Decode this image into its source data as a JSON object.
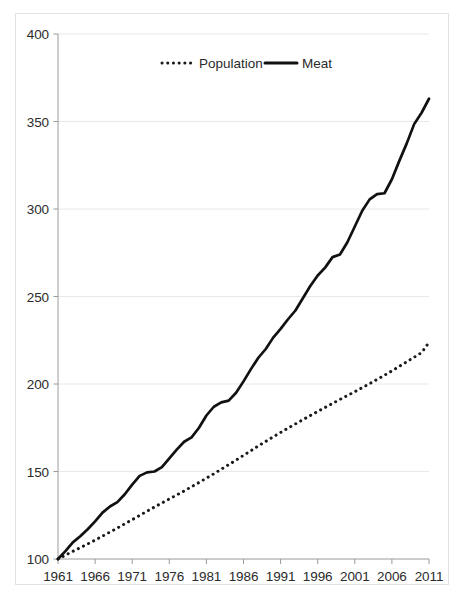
{
  "chart_data": {
    "type": "line",
    "title": "",
    "subtitle": "",
    "xlabel": "",
    "ylabel": "",
    "xlim": [
      1961,
      2011
    ],
    "ylim": [
      100,
      400
    ],
    "grid": true,
    "legend_position": "top-center",
    "y_ticks": [
      "400",
      "350",
      "300",
      "250",
      "200",
      "150",
      "100"
    ],
    "y_tick_values": [
      400,
      350,
      300,
      250,
      200,
      150,
      100
    ],
    "x_ticks": [
      "1961",
      "1966",
      "1971",
      "1976",
      "1981",
      "1986",
      "1991",
      "1996",
      "2001",
      "2006",
      "2011"
    ],
    "x_tick_values": [
      1961,
      1966,
      1971,
      1976,
      1981,
      1986,
      1991,
      1996,
      2001,
      2006,
      2011
    ],
    "x": [
      1961,
      1962,
      1963,
      1964,
      1965,
      1966,
      1967,
      1968,
      1969,
      1970,
      1971,
      1972,
      1973,
      1974,
      1975,
      1976,
      1977,
      1978,
      1979,
      1980,
      1981,
      1982,
      1983,
      1984,
      1985,
      1986,
      1987,
      1988,
      1989,
      1990,
      1991,
      1992,
      1993,
      1994,
      1995,
      1996,
      1997,
      1998,
      1999,
      2000,
      2001,
      2002,
      2003,
      2004,
      2005,
      2006,
      2007,
      2008,
      2009,
      2010,
      2011
    ],
    "series": [
      {
        "name": "Population",
        "style": "dotted",
        "color": "#1a1a1a",
        "values": [
          100.0,
          102.2,
          104.4,
          106.5,
          108.6,
          110.8,
          113.1,
          115.4,
          117.7,
          120.1,
          122.5,
          124.9,
          127.3,
          129.7,
          132.0,
          134.3,
          136.6,
          138.9,
          141.3,
          143.7,
          146.2,
          148.7,
          151.3,
          153.9,
          156.5,
          159.2,
          161.9,
          164.6,
          167.2,
          169.8,
          172.3,
          174.8,
          177.2,
          179.6,
          182.0,
          184.3,
          186.6,
          188.9,
          191.2,
          193.4,
          195.6,
          197.9,
          200.2,
          202.6,
          205.0,
          207.5,
          210.1,
          212.7,
          215.3,
          217.9,
          223.8
        ]
      },
      {
        "name": "Meat",
        "style": "solid",
        "color": "#111111",
        "values": [
          100.0,
          104.5,
          109.5,
          113.0,
          117.0,
          121.5,
          126.5,
          130.0,
          132.5,
          137.0,
          142.5,
          147.5,
          149.5,
          150.0,
          152.5,
          157.5,
          162.5,
          167.0,
          169.5,
          175.0,
          182.0,
          187.0,
          189.5,
          190.5,
          195.0,
          201.5,
          208.5,
          215.0,
          220.0,
          226.5,
          231.5,
          237.0,
          242.0,
          249.0,
          256.0,
          262.0,
          266.5,
          272.5,
          274.0,
          281.0,
          290.0,
          299.0,
          305.5,
          308.5,
          309.0,
          317.0,
          327.5,
          337.5,
          348.5,
          355.0,
          363.0
        ]
      }
    ]
  },
  "legend": {
    "items": [
      {
        "label": "Population",
        "marker": "dotted-line-marker"
      },
      {
        "label": "Meat",
        "marker": "solid-line-marker"
      }
    ]
  },
  "colors": {
    "axis": "#9a9a9a",
    "gridline": "#e8e8e8",
    "text": "#2b2b2b",
    "series_meat": "#111111",
    "series_population": "#1a1a1a",
    "frame_border": "#e2e2e2",
    "background": "#ffffff"
  }
}
